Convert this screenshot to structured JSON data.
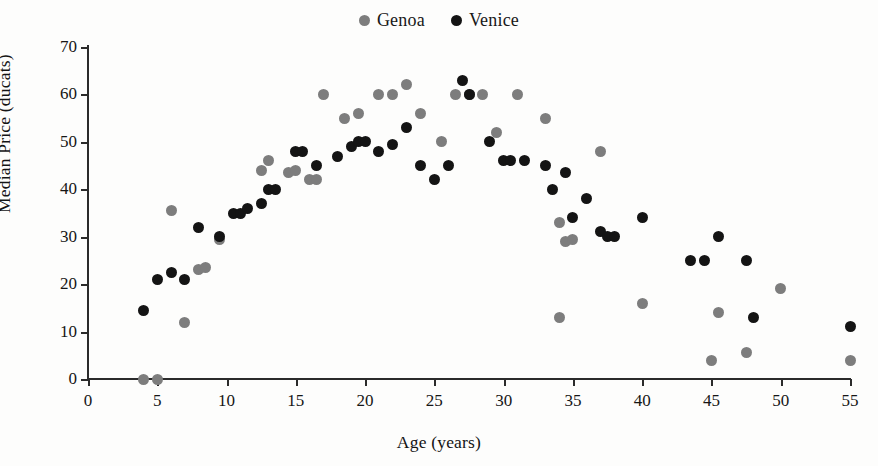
{
  "chart_data": {
    "type": "scatter",
    "title": "",
    "xlabel": "Age (years)",
    "ylabel": "Median Price (ducats)",
    "xlim": [
      0,
      55
    ],
    "ylim": [
      0,
      70
    ],
    "xticks": [
      0,
      5,
      10,
      15,
      20,
      25,
      30,
      35,
      40,
      45,
      50,
      55
    ],
    "yticks": [
      0,
      10,
      20,
      30,
      40,
      50,
      60,
      70
    ],
    "grid": false,
    "legend_position": "top-center",
    "series": [
      {
        "name": "Genoa",
        "color": "#7d7d7d",
        "points": [
          [
            4,
            0
          ],
          [
            5,
            0
          ],
          [
            6,
            35.5
          ],
          [
            7,
            12
          ],
          [
            8,
            23
          ],
          [
            8.5,
            23.5
          ],
          [
            9.5,
            29.5
          ],
          [
            12.5,
            44
          ],
          [
            13,
            46
          ],
          [
            14.5,
            43.5
          ],
          [
            15,
            44
          ],
          [
            16,
            42
          ],
          [
            16.5,
            42
          ],
          [
            17,
            60
          ],
          [
            18.5,
            55
          ],
          [
            19.5,
            56
          ],
          [
            21,
            60
          ],
          [
            22,
            60
          ],
          [
            23,
            62
          ],
          [
            24,
            56
          ],
          [
            25.5,
            50
          ],
          [
            26.5,
            60
          ],
          [
            27.5,
            60
          ],
          [
            28.5,
            60
          ],
          [
            29.5,
            52
          ],
          [
            31,
            60
          ],
          [
            33,
            55
          ],
          [
            34,
            33
          ],
          [
            34.5,
            29
          ],
          [
            35,
            29.5
          ],
          [
            37,
            48
          ],
          [
            40,
            16
          ],
          [
            34,
            13
          ],
          [
            45,
            4
          ],
          [
            45.5,
            14
          ],
          [
            47.5,
            5.5
          ],
          [
            50,
            19
          ],
          [
            55,
            4
          ]
        ]
      },
      {
        "name": "Venice",
        "color": "#141414",
        "points": [
          [
            4,
            14.5
          ],
          [
            5,
            21
          ],
          [
            6,
            22.5
          ],
          [
            7,
            21
          ],
          [
            8,
            32
          ],
          [
            9.5,
            30
          ],
          [
            10.5,
            35
          ],
          [
            11,
            35
          ],
          [
            11.5,
            36
          ],
          [
            12.5,
            37
          ],
          [
            13,
            40
          ],
          [
            13.5,
            40
          ],
          [
            15,
            48
          ],
          [
            15.5,
            48
          ],
          [
            16.5,
            45
          ],
          [
            18,
            47
          ],
          [
            19,
            49
          ],
          [
            19.5,
            50
          ],
          [
            20,
            50
          ],
          [
            21,
            48
          ],
          [
            22,
            49.5
          ],
          [
            23,
            53
          ],
          [
            24,
            45
          ],
          [
            25,
            42
          ],
          [
            26,
            45
          ],
          [
            27,
            63
          ],
          [
            27.5,
            60
          ],
          [
            29,
            50
          ],
          [
            30,
            46
          ],
          [
            30.5,
            46
          ],
          [
            31.5,
            46
          ],
          [
            33,
            45
          ],
          [
            33.5,
            40
          ],
          [
            34.5,
            43.5
          ],
          [
            35,
            34
          ],
          [
            36,
            38
          ],
          [
            37,
            31
          ],
          [
            37.5,
            30
          ],
          [
            38,
            30
          ],
          [
            40,
            34
          ],
          [
            43.5,
            25
          ],
          [
            44.5,
            25
          ],
          [
            45.5,
            30
          ],
          [
            47.5,
            25
          ],
          [
            48,
            13
          ],
          [
            55,
            11
          ]
        ]
      }
    ]
  },
  "legend": {
    "items": [
      {
        "label": "Genoa",
        "color": "#7d7d7d"
      },
      {
        "label": "Venice",
        "color": "#141414"
      }
    ]
  }
}
